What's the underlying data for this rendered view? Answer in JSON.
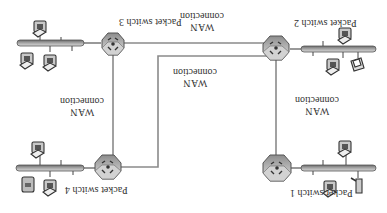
{
  "diagram": {
    "orientation": "rotated-180",
    "switches": [
      {
        "id": "ps1",
        "label": "Packet switch 1"
      },
      {
        "id": "ps2",
        "label": "Packet switch 2"
      },
      {
        "id": "ps3",
        "label": "Packet switch 3"
      },
      {
        "id": "ps4",
        "label": "Packet switch 4"
      }
    ],
    "links": [
      {
        "from": "ps1",
        "to": "ps2",
        "label_line1": "WAN",
        "label_line2": "connection"
      },
      {
        "from": "ps1",
        "to": "ps3",
        "label_line1": "WAN",
        "label_line2": "connection"
      },
      {
        "from": "ps2",
        "to": "ps4",
        "label_line1": "WAN",
        "label_line2": "connection"
      },
      {
        "from": "ps3",
        "to": "ps4",
        "label_line1": "WAN",
        "label_line2": "connection"
      }
    ],
    "colors": {
      "line": "#8a8a8a",
      "bus": "#9a9a9a",
      "switch_fill": "#b8b8b8",
      "text": "#333333"
    }
  }
}
